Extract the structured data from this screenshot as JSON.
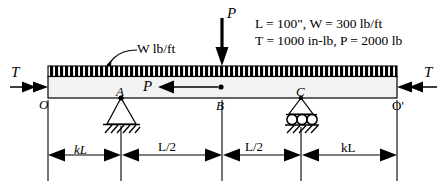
{
  "figure": {
    "type": "beam-free-body-diagram",
    "background_color": "#ffffff",
    "line_color": "#000000",
    "beam_fill_color": "#f0f0f0",
    "hatch_color": "#000000"
  },
  "loads": {
    "point_load_top_label": "P",
    "distributed_load_label": "W lb/ft",
    "internal_axial_label": "P",
    "end_torque_left_label": "T",
    "end_torque_right_label": "T"
  },
  "given_values": {
    "line1": "L = 100\", W = 300 lb/ft",
    "line2": "T = 1000 in-lb, P = 2000 lb",
    "L": "100\"",
    "W": "300 lb/ft",
    "T": "1000 in-lb",
    "P": "2000 lb"
  },
  "points": {
    "left_end": "O",
    "pin_support": "A",
    "midspan": "B",
    "roller_support": "C",
    "right_end": "O'"
  },
  "dimensions": [
    {
      "label": "kL",
      "name": "dim-left-overhang"
    },
    {
      "label": "L/2",
      "name": "dim-left-span"
    },
    {
      "label": "L/2",
      "name": "dim-right-span"
    },
    {
      "label": "kL",
      "name": "dim-right-overhang"
    }
  ],
  "supports": {
    "pin": {
      "label": "A",
      "type": "pin-support"
    },
    "roller": {
      "label": "C",
      "type": "roller-support",
      "roller_count": 3
    }
  }
}
